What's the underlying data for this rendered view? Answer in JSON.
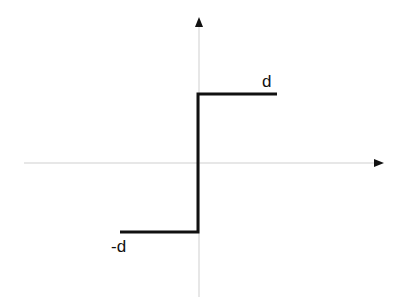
{
  "diagram": {
    "type": "signum step function",
    "labels": {
      "upper_level": "d",
      "lower_level": "-d"
    },
    "colors": {
      "axis": "#cfcfcf",
      "arrow": "#111111",
      "curve": "#111111",
      "background": "#ffffff"
    },
    "function": {
      "description": "piecewise constant: -d for x<0, d for x>0",
      "segments": [
        {
          "x_from": -1,
          "x_to": 0,
          "y": -1
        },
        {
          "x_from": 0,
          "x_to": 0,
          "y_from": -1,
          "y_to": 1
        },
        {
          "x_from": 0,
          "x_to": 1,
          "y": 1
        }
      ]
    }
  }
}
